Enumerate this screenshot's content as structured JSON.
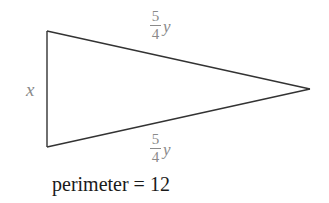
{
  "figure": {
    "shape": "isosceles-triangle",
    "stroke_color": "#333333",
    "label_color": "#8a8a8a",
    "vertices": {
      "top_left": [
        47,
        31
      ],
      "bottom_left": [
        47,
        147
      ],
      "right": [
        310,
        89
      ]
    },
    "sides": {
      "left": {
        "label": "x"
      },
      "top": {
        "numerator": "5",
        "denominator": "4",
        "variable": "y"
      },
      "bottom": {
        "numerator": "5",
        "denominator": "4",
        "variable": "y"
      }
    }
  },
  "caption": {
    "text": "perimeter = 12"
  }
}
